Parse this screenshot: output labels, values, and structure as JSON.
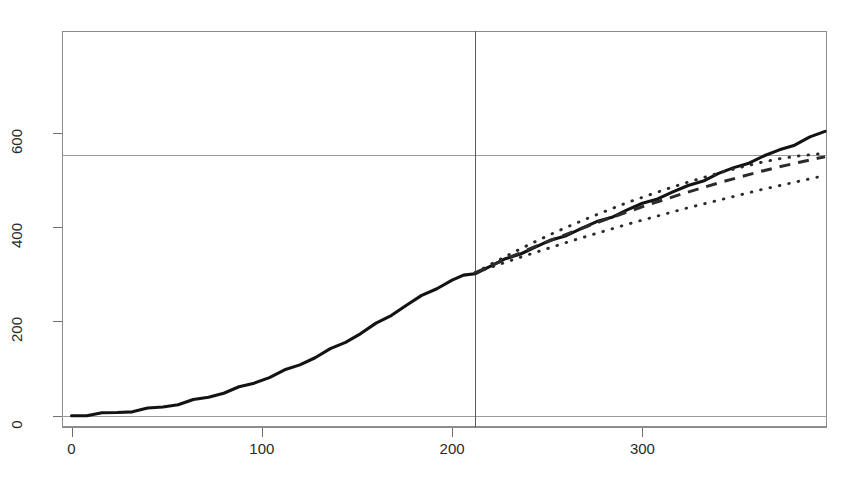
{
  "chart_title": "",
  "chart_data": {
    "type": "line",
    "title": "",
    "subtitle": "",
    "xlabel": "",
    "ylabel": "",
    "xlim": [
      -5,
      397
    ],
    "ylim": [
      -24,
      816
    ],
    "grid": true,
    "legend_position": "none",
    "x_ticks": [
      0,
      100,
      200,
      300
    ],
    "y_ticks": [
      0,
      200,
      400,
      600
    ],
    "x_tick_labels": [
      "0",
      "100",
      "200",
      "300"
    ],
    "y_tick_labels": [
      "0",
      "200",
      "400",
      "600"
    ],
    "reference_lines": {
      "vertical_x": 212,
      "horizontal_y": [
        0,
        552
      ]
    },
    "series": [
      {
        "name": "observed-cumulative",
        "style": "solid",
        "color": "#131313",
        "x": [
          0,
          8,
          16,
          24,
          32,
          40,
          48,
          56,
          64,
          72,
          80,
          88,
          96,
          104,
          112,
          120,
          128,
          136,
          144,
          152,
          160,
          168,
          176,
          184,
          192,
          200,
          206,
          212,
          220,
          228,
          236,
          244,
          252,
          260,
          268,
          276,
          284,
          292,
          300,
          308,
          316,
          324,
          332,
          340,
          348,
          356,
          364,
          372,
          380,
          388,
          396
        ],
        "values": [
          0,
          2,
          4,
          7,
          10,
          14,
          19,
          25,
          32,
          40,
          49,
          59,
          70,
          82,
          95,
          109,
          124,
          140,
          157,
          175,
          194,
          214,
          235,
          253,
          271,
          288,
          296,
          303,
          317,
          331,
          345,
          358,
          371,
          384,
          397,
          410,
          423,
          436,
          449,
          462,
          474,
          487,
          500,
          513,
          525,
          538,
          550,
          563,
          576,
          590,
          603
        ]
      },
      {
        "name": "forecast-mean",
        "style": "dashed",
        "color": "#2b2b2b",
        "x": [
          212,
          222,
          232,
          242,
          252,
          262,
          272,
          282,
          292,
          302,
          312,
          322,
          332,
          342,
          352,
          362,
          372,
          382,
          392,
          396
        ],
        "values": [
          303,
          321,
          339,
          356,
          372,
          388,
          403,
          418,
          432,
          446,
          459,
          472,
          484,
          496,
          507,
          518,
          528,
          537,
          546,
          549
        ]
      },
      {
        "name": "forecast-upper-bound",
        "style": "dotted",
        "color": "#2b2b2b",
        "x": [
          212,
          222,
          232,
          242,
          252,
          262,
          272,
          282,
          292,
          302,
          312,
          322,
          332,
          342,
          352,
          362,
          372,
          382,
          392,
          396
        ],
        "values": [
          303,
          325,
          346,
          366,
          385,
          403,
          420,
          436,
          452,
          466,
          480,
          493,
          505,
          517,
          527,
          537,
          545,
          551,
          555,
          556
        ]
      },
      {
        "name": "forecast-lower-bound",
        "style": "dotted",
        "color": "#2b2b2b",
        "x": [
          212,
          222,
          232,
          242,
          252,
          262,
          272,
          282,
          292,
          302,
          312,
          322,
          332,
          342,
          352,
          362,
          372,
          382,
          392,
          396
        ],
        "values": [
          303,
          317,
          331,
          344,
          357,
          370,
          382,
          394,
          406,
          417,
          428,
          439,
          449,
          459,
          469,
          479,
          488,
          497,
          506,
          510
        ]
      }
    ]
  }
}
